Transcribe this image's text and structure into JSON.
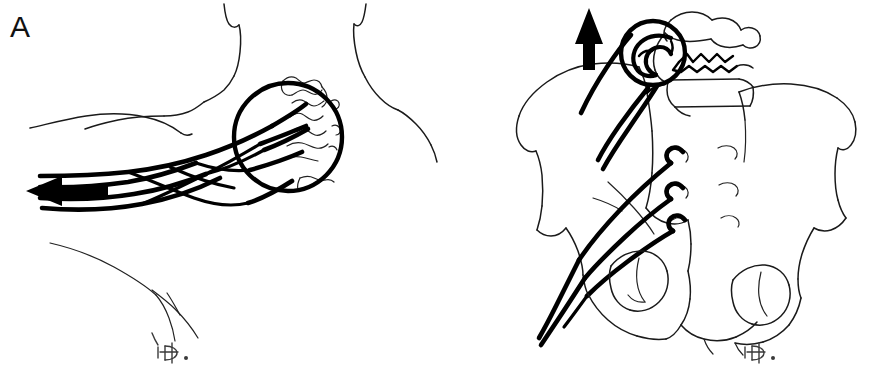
{
  "figure": {
    "kind": "two-panel surgical line illustration",
    "background_color": "#ffffff",
    "ink_color": "#000000",
    "width": 885,
    "height": 374
  },
  "panels": [
    {
      "id": "A",
      "label": "A",
      "label_position": "top-left",
      "subject": "posterior neck and cervical spine",
      "annotations": {
        "arrow": {
          "name": "traction-arrow",
          "direction": "left",
          "style": "solid filled arrowhead"
        },
        "lens": {
          "name": "magnifier-circle",
          "shape": "circle",
          "contents": "cervical spinous processes with wire tips"
        },
        "wires": {
          "name": "braided-wire-bundle",
          "count": 4,
          "description": "braided crossing strands exiting to the left"
        },
        "signature": "D."
      }
    },
    {
      "id": "B",
      "label": "B",
      "label_position": "top-left",
      "subject": "pelvis, sacrum and lumbar vertebrae",
      "annotations": {
        "arrow": {
          "name": "traction-arrow",
          "direction": "up",
          "style": "solid filled arrowhead"
        },
        "lens": {
          "name": "magnifier-circle",
          "shape": "circle",
          "contents": "coiled wire detail at lumbar level"
        },
        "wires": {
          "name": "sacral-wire-bundle",
          "count": 6,
          "description": "wires hooked into sacral foramina converging to lower left"
        },
        "signature": "D."
      }
    }
  ],
  "labels": {
    "panel_a": "A",
    "panel_b": "B"
  }
}
